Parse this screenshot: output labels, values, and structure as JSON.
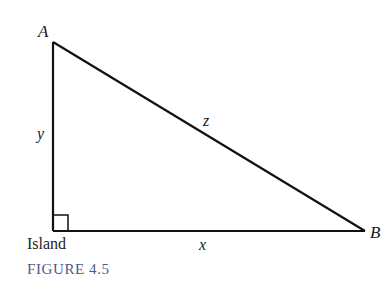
{
  "figure": {
    "caption": "FIGURE 4.5",
    "vertices": {
      "A": {
        "label": "A",
        "x": 53,
        "y": 42
      },
      "B": {
        "label": "B",
        "x": 365,
        "y": 231
      },
      "island": {
        "label": "Island",
        "x": 53,
        "y": 231
      }
    },
    "sides": {
      "vertical": {
        "label": "y"
      },
      "horizontal": {
        "label": "x"
      },
      "hypotenuse": {
        "label": "z"
      }
    },
    "right_angle_marker": true,
    "colors": {
      "line": "#111111",
      "caption": "#4a5a8e"
    }
  }
}
